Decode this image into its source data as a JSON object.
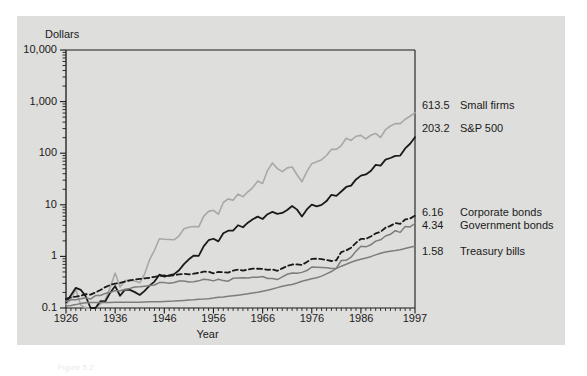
{
  "figure": {
    "caption": "Figure 5.2",
    "panel_bg": "#dededc",
    "page_bg": "#ffffff"
  },
  "chart_data": {
    "type": "line",
    "title": "",
    "xlabel": "Year",
    "ylabel": "Dollars",
    "ylabel_position": "top-left",
    "grid": false,
    "legend": "right-of-axis end labels",
    "yscale": "log",
    "ylim": [
      0.1,
      10000
    ],
    "ytick_labels": [
      "10,000",
      "1,000",
      "100",
      "10",
      "1",
      "0.1"
    ],
    "ytick_values": [
      10000,
      1000,
      100,
      10,
      1,
      0.1
    ],
    "yminor_ticks": true,
    "xlim": [
      1926,
      1997
    ],
    "xtick_labels": [
      "1926",
      "1936",
      "1946",
      "1956",
      "1966",
      "1976",
      "1986",
      "1997"
    ],
    "xtick_values": [
      1926,
      1936,
      1946,
      1956,
      1966,
      1976,
      1986,
      1997
    ],
    "xminor_ticks": "annual",
    "x": [
      1926,
      1927,
      1928,
      1929,
      1930,
      1931,
      1932,
      1933,
      1934,
      1935,
      1936,
      1937,
      1938,
      1939,
      1940,
      1941,
      1942,
      1943,
      1944,
      1945,
      1946,
      1947,
      1948,
      1949,
      1950,
      1951,
      1952,
      1953,
      1954,
      1955,
      1956,
      1957,
      1958,
      1959,
      1960,
      1961,
      1962,
      1963,
      1964,
      1965,
      1966,
      1967,
      1968,
      1969,
      1970,
      1971,
      1972,
      1973,
      1974,
      1975,
      1976,
      1977,
      1978,
      1979,
      1980,
      1981,
      1982,
      1983,
      1984,
      1985,
      1986,
      1987,
      1988,
      1989,
      1990,
      1991,
      1992,
      1993,
      1994,
      1995,
      1996,
      1997
    ],
    "series": [
      {
        "name": "Small firms",
        "end_value": 613.5,
        "end_label": "613.5",
        "color": "#a8a8a8",
        "style": "solid",
        "width": 1.6,
        "values": [
          1.0,
          1.22,
          1.95,
          0.96,
          0.5,
          0.24,
          0.29,
          1.01,
          1.23,
          2.14,
          4.01,
          2.16,
          2.86,
          2.93,
          2.82,
          2.6,
          3.89,
          7.26,
          11.1,
          18.6,
          18.1,
          17.9,
          17.7,
          21.2,
          28.9,
          31.0,
          32.1,
          31.6,
          50.3,
          62.9,
          66.0,
          55.5,
          93.5,
          110.0,
          103.0,
          136.0,
          121.0,
          151.0,
          182.0,
          244.0,
          219.0,
          393.0,
          545.0,
          424.0,
          372.0,
          439.0,
          455.0,
          322.0,
          236.0,
          372.0,
          530.0,
          577.0,
          632.0,
          762.0,
          1010.0,
          1000.0,
          1190.0,
          1640.0,
          1490.0,
          1800.0,
          1870.0,
          1600.0,
          1880.0,
          2040.0,
          1700.0,
          2420.0,
          2840.0,
          3160.0,
          3160.0,
          3840.0,
          4390.0,
          5180.0
        ],
        "note": "values shown are index-from-1926; plotted end label is 613.5"
      },
      {
        "name": "S&P 500",
        "end_value": 203.2,
        "end_label": "203.2",
        "color": "#1a1a1a",
        "style": "solid",
        "width": 1.8,
        "values": [
          1.0,
          1.38,
          1.92,
          1.76,
          1.32,
          0.75,
          0.69,
          1.06,
          1.05,
          1.55,
          2.08,
          1.35,
          1.77,
          1.76,
          1.59,
          1.4,
          1.68,
          2.12,
          2.54,
          3.46,
          3.18,
          3.36,
          3.55,
          4.21,
          5.55,
          6.88,
          8.11,
          8.03,
          12.25,
          16.1,
          17.2,
          15.3,
          22.0,
          24.6,
          24.7,
          31.4,
          28.7,
          35.2,
          41.0,
          46.1,
          41.5,
          51.4,
          57.1,
          52.2,
          54.3,
          62.1,
          73.9,
          63.0,
          46.3,
          63.5,
          78.7,
          73.1,
          77.9,
          92.3,
          122.2,
          116.2,
          141.3,
          173.1,
          184.1,
          242.6,
          287.7,
          302.7,
          353.0,
          464.6,
          450.1,
          587.0,
          631.6,
          695.2,
          704.5,
          968.9,
          1191.4,
          1589.0
        ],
        "note": "values shown are index-from-1926; plotted end label is 203.2"
      },
      {
        "name": "Corporate bonds",
        "end_value": 6.16,
        "end_label": "6.16",
        "color": "#1a1a1a",
        "style": "dashed",
        "width": 1.8,
        "values": [
          1.0,
          1.08,
          1.11,
          1.15,
          1.24,
          1.21,
          1.34,
          1.49,
          1.7,
          1.86,
          1.99,
          2.04,
          2.17,
          2.29,
          2.37,
          2.44,
          2.5,
          2.57,
          2.69,
          2.8,
          2.85,
          2.81,
          2.89,
          3.0,
          3.07,
          2.99,
          3.09,
          3.2,
          3.38,
          3.37,
          3.13,
          3.36,
          3.3,
          3.25,
          3.54,
          3.72,
          3.55,
          3.71,
          3.87,
          3.85,
          3.83,
          3.65,
          3.75,
          3.51,
          3.92,
          4.35,
          4.65,
          4.67,
          4.56,
          5.19,
          5.96,
          6.02,
          5.92,
          5.67,
          5.44,
          5.62,
          8.12,
          8.7,
          9.83,
          12.24,
          14.63,
          14.58,
          16.22,
          18.59,
          20.03,
          24.03,
          26.12,
          29.49,
          28.51,
          34.69,
          36.14,
          41.15
        ],
        "note": "values shown are index-from-1926; plotted end label is 6.16"
      },
      {
        "name": "Government bonds",
        "end_value": 4.34,
        "end_label": "4.34",
        "color": "#7d7d7d",
        "style": "solid",
        "width": 1.5,
        "values": [
          1.0,
          1.09,
          1.09,
          1.13,
          1.18,
          1.12,
          1.31,
          1.31,
          1.44,
          1.51,
          1.62,
          1.62,
          1.71,
          1.8,
          1.91,
          1.93,
          1.99,
          2.04,
          2.1,
          2.33,
          2.33,
          2.26,
          2.34,
          2.5,
          2.5,
          2.4,
          2.43,
          2.52,
          2.7,
          2.66,
          2.52,
          2.71,
          2.55,
          2.49,
          2.83,
          2.86,
          2.88,
          2.85,
          2.95,
          2.96,
          3.07,
          2.8,
          2.81,
          2.67,
          3.0,
          3.39,
          3.57,
          3.53,
          3.68,
          3.99,
          4.66,
          4.64,
          4.59,
          4.54,
          4.36,
          4.44,
          6.25,
          6.31,
          7.25,
          9.49,
          11.79,
          11.49,
          12.6,
          14.85,
          15.72,
          18.64,
          20.11,
          23.64,
          21.95,
          28.48,
          27.9,
          32.58
        ],
        "note": "values shown are index-from-1926; plotted end label is 4.34"
      },
      {
        "name": "Treasury bills",
        "end_value": 1.58,
        "end_label": "1.58",
        "color": "#7d7d7d",
        "style": "solid",
        "width": 1.5,
        "values": [
          1.0,
          1.03,
          1.07,
          1.12,
          1.16,
          1.17,
          1.18,
          1.18,
          1.18,
          1.18,
          1.19,
          1.19,
          1.19,
          1.19,
          1.19,
          1.19,
          1.2,
          1.21,
          1.21,
          1.22,
          1.23,
          1.24,
          1.25,
          1.27,
          1.29,
          1.31,
          1.33,
          1.36,
          1.37,
          1.39,
          1.43,
          1.48,
          1.5,
          1.55,
          1.59,
          1.63,
          1.68,
          1.73,
          1.79,
          1.86,
          1.95,
          2.03,
          2.14,
          2.28,
          2.43,
          2.54,
          2.63,
          2.81,
          3.04,
          3.22,
          3.38,
          3.55,
          3.81,
          4.21,
          4.68,
          5.37,
          5.94,
          6.46,
          7.1,
          7.64,
          8.11,
          8.55,
          9.09,
          9.85,
          10.62,
          11.21,
          11.61,
          11.95,
          12.42,
          13.12,
          13.8,
          14.53
        ],
        "note": "values shown are index-from-1926; plotted end label is 1.58"
      }
    ]
  },
  "axis": {
    "y_ticks": [
      {
        "label": "10,000",
        "y": 50
      },
      {
        "label": "1,000",
        "y": 101.6
      },
      {
        "label": "100",
        "y": 153.2
      },
      {
        "label": "10",
        "y": 204.8
      },
      {
        "label": "1",
        "y": 256.4
      },
      {
        "label": "0.1",
        "y": 308
      }
    ],
    "x_ticks": [
      {
        "label": "1926",
        "x": 66
      },
      {
        "label": "1936",
        "x": 115.2
      },
      {
        "label": "1946",
        "x": 164.4
      },
      {
        "label": "1956",
        "x": 213.6
      },
      {
        "label": "1966",
        "x": 262.8
      },
      {
        "label": "1976",
        "x": 312.0
      },
      {
        "label": "1986",
        "x": 361.2
      },
      {
        "label": "1997",
        "x": 415
      }
    ]
  },
  "end_labels": [
    {
      "value": "613.5",
      "name": "Small firms",
      "y": 105
    },
    {
      "value": "203.2",
      "name": "S&P 500",
      "y": 128
    },
    {
      "value": "6.16",
      "name": "Corporate bonds",
      "y": 212
    },
    {
      "value": "4.34",
      "name": "Government bonds",
      "y": 225
    },
    {
      "value": "1.58",
      "name": "Treasury bills",
      "y": 251
    }
  ]
}
